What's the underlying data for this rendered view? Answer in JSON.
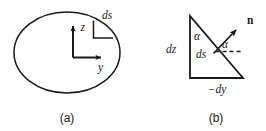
{
  "figure": {
    "background_color": "#ffffff",
    "ink_color": "#1a1a1a",
    "panels": [
      {
        "id": "panel-a",
        "caption": "(a)",
        "description": "ellipse cross-section with z and y axes and a ds surface element bracket",
        "labels": {
          "z_axis": "z",
          "y_axis": "y",
          "surface_element": "ds"
        }
      },
      {
        "id": "panel-b",
        "caption": "(b)",
        "description": "right triangle showing the differential surface element ds with legs dz and -dy, normal vector n, and angles alpha",
        "labels": {
          "vertical_leg": "dz",
          "horizontal_leg": "−dy",
          "hypotenuse": "ds",
          "normal_vector": "n",
          "angle_apex": "α",
          "angle_normal": "α"
        }
      }
    ]
  }
}
